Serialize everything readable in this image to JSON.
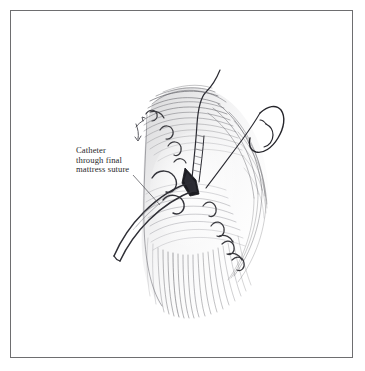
{
  "plate": {
    "background_color": "#ffffff",
    "frame_color": "#6e6e70",
    "ink_color": "#2a2a2c"
  },
  "caption": {
    "lines": [
      "Catheter",
      "through final",
      "mattress suture"
    ],
    "full_text": "Catheter through final mattress suture"
  },
  "illustration": {
    "title": "Catheter through final mattress suture",
    "subject": "surgical-technique-line-drawing",
    "elements": [
      {
        "name": "tissue-mass",
        "description": "hatched ovoid tissue body with directional stroke shading"
      },
      {
        "name": "catheter-tube",
        "description": "double-line tube entering tissue and curving to lower left"
      },
      {
        "name": "suture-opening",
        "description": "dark triangular aperture at catheter entry"
      },
      {
        "name": "mattress-sutures",
        "description": "row of looped stitch arcs across tissue surface"
      },
      {
        "name": "suture-thread-vertical",
        "description": "long thread rising from tissue toward top of plate"
      },
      {
        "name": "curved-needle",
        "description": "curved surgical needle with trailing thread at upper right"
      },
      {
        "name": "leader-line",
        "description": "thin line from caption to catheter"
      }
    ]
  }
}
